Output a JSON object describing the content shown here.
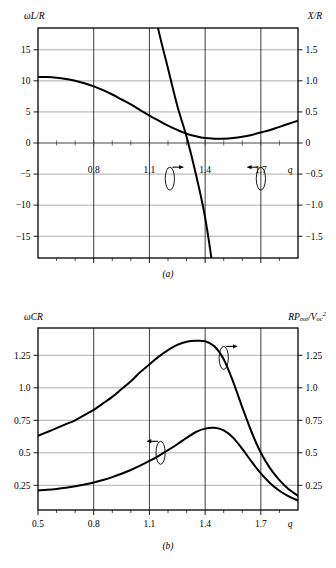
{
  "figure": {
    "panels": [
      {
        "id": "a",
        "caption": "(a)",
        "left_axis_label": "ωL/R",
        "right_axis_label": "X/R",
        "x_axis_label": "q"
      },
      {
        "id": "b",
        "caption": "(b)",
        "left_axis_label": "ωCR",
        "right_axis_label_main": "RP",
        "right_axis_label_sub1": "out",
        "right_axis_label_mid": "/V",
        "right_axis_label_sub2": "oc",
        "right_axis_label_sup": "2",
        "x_axis_label": "q"
      }
    ]
  },
  "chart_data": [
    {
      "type": "line",
      "panel": "a",
      "title": "(a)",
      "xlabel": "q",
      "ylabel": "ωL/R",
      "ylabel_right": "X/R",
      "xlim": [
        0.5,
        1.9
      ],
      "ylim": [
        -18.5,
        18.5
      ],
      "ylim_right": [
        -1.85,
        1.85
      ],
      "grid": true,
      "xticks": [
        0.8,
        1.1,
        1.4,
        1.7
      ],
      "xticklabels": [
        "0.8",
        "1.1",
        "1.4",
        "1.7"
      ],
      "xminorticks": [
        0.6,
        0.7,
        0.9,
        1.0,
        1.2,
        1.3,
        1.5,
        1.6,
        1.8
      ],
      "yticks": [
        -15,
        -10,
        -5,
        0,
        5,
        10,
        15
      ],
      "yticklabels": [
        "−15",
        "−10",
        "−5",
        "0",
        "5",
        "10",
        "15"
      ],
      "yticks_right": [
        -1.5,
        -1.0,
        -0.5,
        0,
        0.5,
        1.0,
        1.5
      ],
      "yticklabels_right": [
        "−1.5",
        "−1.0",
        "−0.5",
        "0",
        "0.5",
        "1.0",
        "1.5"
      ],
      "annotations": [
        {
          "name": "left-curve-pointer",
          "axis": "right",
          "arrow": "right",
          "x": 1.21,
          "y_frac": 0.655
        },
        {
          "name": "right-curve-pointer",
          "axis": "left",
          "arrow": "left",
          "x": 1.7,
          "y_frac": 0.655
        }
      ],
      "series": [
        {
          "name": "X/R",
          "axis": "right",
          "arrow": "right",
          "x": [
            0.5,
            0.55,
            0.6,
            0.65,
            0.7,
            0.75,
            0.8,
            0.85,
            0.9,
            0.95,
            1.0,
            1.05,
            1.1,
            1.15,
            1.2,
            1.25,
            1.3,
            1.35,
            1.4,
            1.45,
            1.5,
            1.55,
            1.6,
            1.65,
            1.7,
            1.75,
            1.8,
            1.85,
            1.9
          ],
          "values": [
            18.5,
            15.1,
            12.6,
            10.7,
            9.2,
            8.0,
            7.0,
            6.1,
            5.3,
            4.6,
            3.9,
            3.2,
            2.5,
            1.8,
            1.2,
            0.6,
            0.1,
            -0.5,
            -1.2,
            -2.2,
            -3.4,
            -4.9,
            -6.6,
            -8.6,
            -10.8,
            -13.2,
            -15.8,
            -17.6,
            -18.5
          ],
          "note": "steeply descending curve, zero crossing near q=1.37"
        },
        {
          "name": "ωL/R",
          "axis": "left",
          "arrow": "left",
          "x": [
            0.5,
            0.55,
            0.6,
            0.65,
            0.7,
            0.75,
            0.8,
            0.85,
            0.9,
            0.95,
            1.0,
            1.05,
            1.1,
            1.15,
            1.2,
            1.25,
            1.3,
            1.35,
            1.4,
            1.45,
            1.5,
            1.55,
            1.6,
            1.65,
            1.7,
            1.75,
            1.8,
            1.85,
            1.9
          ],
          "values": [
            10.6,
            10.6,
            10.5,
            10.3,
            10.0,
            9.6,
            9.1,
            8.5,
            7.8,
            7.0,
            6.2,
            5.3,
            4.4,
            3.6,
            2.8,
            2.1,
            1.5,
            1.1,
            0.8,
            0.7,
            0.7,
            0.8,
            1.0,
            1.3,
            1.7,
            2.1,
            2.6,
            3.1,
            3.6
          ],
          "note": "shallow U-shaped curve with minimum near q=1.47"
        }
      ]
    },
    {
      "type": "line",
      "panel": "b",
      "title": "(b)",
      "xlabel": "q",
      "ylabel": "ωCR",
      "ylabel_right": "RP_out/V_oc²",
      "xlim": [
        0.5,
        1.9
      ],
      "ylim": [
        0.06,
        1.46
      ],
      "ylim_right": [
        0.06,
        1.46
      ],
      "grid": true,
      "xticks": [
        0.5,
        0.8,
        1.1,
        1.4,
        1.7
      ],
      "xticklabels": [
        "0.5",
        "0.8",
        "1.1",
        "1.4",
        "1.7"
      ],
      "xminorticks": [
        0.6,
        0.7,
        0.9,
        1.0,
        1.2,
        1.3,
        1.5,
        1.6,
        1.8
      ],
      "yticks": [
        0.25,
        0.5,
        0.75,
        1.0,
        1.25
      ],
      "yticklabels": [
        "0.25",
        "0.5",
        "0.75",
        "1.0",
        "1.25"
      ],
      "yticks_right": [
        0.25,
        0.5,
        0.75,
        1.0,
        1.25
      ],
      "yticklabels_right": [
        "0.25",
        "0.5",
        "0.75",
        "1.0",
        "1.25"
      ],
      "annotations": [
        {
          "name": "upper-curve-pointer",
          "axis": "right",
          "arrow": "right",
          "x": 1.5,
          "y": 1.23
        },
        {
          "name": "lower-curve-pointer",
          "axis": "left",
          "arrow": "left",
          "x": 1.16,
          "y": 0.5
        }
      ],
      "series": [
        {
          "name": "RP_out/V_oc²",
          "axis": "right",
          "arrow": "right",
          "peak_x": 1.4,
          "peak_y": 1.36,
          "x": [
            0.5,
            0.55,
            0.6,
            0.65,
            0.7,
            0.75,
            0.8,
            0.85,
            0.9,
            0.95,
            1.0,
            1.05,
            1.1,
            1.15,
            1.2,
            1.25,
            1.3,
            1.35,
            1.4,
            1.45,
            1.5,
            1.55,
            1.6,
            1.65,
            1.7,
            1.75,
            1.8,
            1.85,
            1.9
          ],
          "values": [
            0.63,
            0.66,
            0.69,
            0.72,
            0.75,
            0.79,
            0.83,
            0.88,
            0.93,
            0.99,
            1.05,
            1.12,
            1.18,
            1.24,
            1.29,
            1.33,
            1.355,
            1.362,
            1.358,
            1.32,
            1.22,
            1.05,
            0.85,
            0.66,
            0.5,
            0.38,
            0.29,
            0.22,
            0.17
          ]
        },
        {
          "name": "ωCR",
          "axis": "left",
          "arrow": "left",
          "peak_x": 1.45,
          "peak_y": 0.69,
          "x": [
            0.5,
            0.55,
            0.6,
            0.65,
            0.7,
            0.75,
            0.8,
            0.85,
            0.9,
            0.95,
            1.0,
            1.05,
            1.1,
            1.15,
            1.2,
            1.25,
            1.3,
            1.35,
            1.4,
            1.45,
            1.5,
            1.55,
            1.6,
            1.65,
            1.7,
            1.75,
            1.8,
            1.85,
            1.9
          ],
          "values": [
            0.21,
            0.215,
            0.222,
            0.231,
            0.242,
            0.256,
            0.272,
            0.291,
            0.313,
            0.339,
            0.368,
            0.401,
            0.437,
            0.477,
            0.52,
            0.566,
            0.615,
            0.66,
            0.686,
            0.692,
            0.672,
            0.617,
            0.53,
            0.432,
            0.341,
            0.266,
            0.208,
            0.165,
            0.133
          ]
        }
      ]
    }
  ]
}
